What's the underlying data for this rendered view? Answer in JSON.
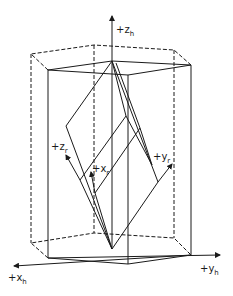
{
  "diagram": {
    "colors": {
      "line": "#1a1a1a",
      "background": "#ffffff"
    },
    "labels": {
      "z_h": {
        "sign": "+",
        "letter": "z",
        "sub": "h"
      },
      "x_h": {
        "sign": "+",
        "letter": "x",
        "sub": "h"
      },
      "y_h": {
        "sign": "+",
        "letter": "y",
        "sub": "h"
      },
      "z_r": {
        "sign": "+",
        "letter": "z",
        "sub": "r"
      },
      "x_r": {
        "sign": "+",
        "letter": "x",
        "sub": "r"
      },
      "y_r": {
        "sign": "+",
        "letter": "y",
        "sub": "r"
      }
    }
  }
}
